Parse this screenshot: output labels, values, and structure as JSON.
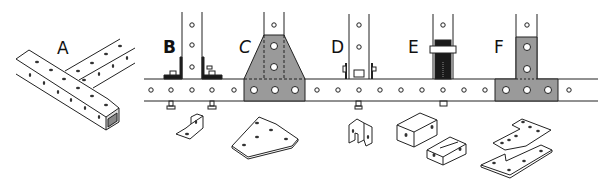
{
  "figure": {
    "panels": [
      {
        "id": "A",
        "label": "A",
        "name": "tube-junction"
      },
      {
        "id": "B",
        "label": "B",
        "name": "angle-bracket-joint"
      },
      {
        "id": "C",
        "label": "C",
        "name": "gusset-plate-joint"
      },
      {
        "id": "D",
        "label": "D",
        "name": "u-bracket-joint"
      },
      {
        "id": "E",
        "label": "E",
        "name": "insert-block-joint"
      },
      {
        "id": "F",
        "label": "F",
        "name": "t-plate-joint"
      }
    ],
    "colors": {
      "line": "#222222",
      "plate_fill": "#9a9a9a",
      "dark_fill": "#1a1a1a",
      "background": "#ffffff"
    }
  }
}
